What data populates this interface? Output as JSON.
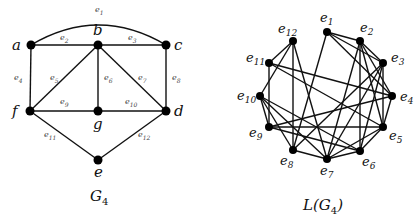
{
  "graph_g4": {
    "caption": "G",
    "caption_sub": "4",
    "vertices": [
      {
        "id": "a",
        "label": "a",
        "x": 31,
        "y": 45,
        "lx": 12,
        "ly": 50
      },
      {
        "id": "b",
        "label": "b",
        "x": 98,
        "y": 45,
        "lx": 93,
        "ly": 35
      },
      {
        "id": "c",
        "label": "c",
        "x": 166,
        "y": 45,
        "lx": 174,
        "ly": 50
      },
      {
        "id": "f",
        "label": "f",
        "x": 30,
        "y": 111,
        "lx": 12,
        "ly": 116
      },
      {
        "id": "g",
        "label": "g",
        "x": 98,
        "y": 111,
        "lx": 93,
        "ly": 129
      },
      {
        "id": "d",
        "label": "d",
        "x": 166,
        "y": 111,
        "lx": 174,
        "ly": 116
      },
      {
        "id": "e",
        "label": "e",
        "x": 98,
        "y": 160,
        "lx": 94,
        "ly": 177
      }
    ],
    "edges": [
      {
        "id": "e1",
        "label": "e",
        "sub": "1",
        "from": "a",
        "to": "c",
        "curved": true,
        "lx": 95,
        "ly": 12
      },
      {
        "id": "e2",
        "label": "e",
        "sub": "2",
        "from": "a",
        "to": "b",
        "lx": 60,
        "ly": 40
      },
      {
        "id": "e3",
        "label": "e",
        "sub": "3",
        "from": "b",
        "to": "c",
        "lx": 128,
        "ly": 40
      },
      {
        "id": "e4",
        "label": "e",
        "sub": "4",
        "from": "a",
        "to": "f",
        "lx": 14,
        "ly": 80
      },
      {
        "id": "e5",
        "label": "e",
        "sub": "5",
        "from": "b",
        "to": "f",
        "lx": 50,
        "ly": 80
      },
      {
        "id": "e6",
        "label": "e",
        "sub": "6",
        "from": "b",
        "to": "g",
        "lx": 104,
        "ly": 80
      },
      {
        "id": "e7",
        "label": "e",
        "sub": "7",
        "from": "b",
        "to": "d",
        "lx": 138,
        "ly": 80
      },
      {
        "id": "e8",
        "label": "e",
        "sub": "8",
        "from": "c",
        "to": "d",
        "lx": 172,
        "ly": 80
      },
      {
        "id": "e9",
        "label": "e",
        "sub": "9",
        "from": "f",
        "to": "g",
        "lx": 60,
        "ly": 104
      },
      {
        "id": "e10",
        "label": "e",
        "sub": "10",
        "from": "g",
        "to": "d",
        "lx": 125,
        "ly": 104
      },
      {
        "id": "e11",
        "label": "e",
        "sub": "11",
        "from": "f",
        "to": "e",
        "lx": 44,
        "ly": 137
      },
      {
        "id": "e12",
        "label": "e",
        "sub": "12",
        "from": "d",
        "to": "e",
        "lx": 138,
        "ly": 137
      }
    ]
  },
  "line_graph": {
    "caption": "L(G",
    "caption_sub": "4",
    "caption_end": ")",
    "vertices": [
      {
        "id": "e1",
        "label": "e",
        "sub": "1",
        "x": 327,
        "y": 32,
        "lx": 320,
        "ly": 22
      },
      {
        "id": "e2",
        "label": "e",
        "sub": "2",
        "x": 360,
        "y": 41,
        "lx": 360,
        "ly": 32
      },
      {
        "id": "e3",
        "label": "e",
        "sub": "3",
        "x": 383,
        "y": 63,
        "lx": 391,
        "ly": 62
      },
      {
        "id": "e4",
        "label": "e",
        "sub": "4",
        "x": 392,
        "y": 96,
        "lx": 400,
        "ly": 101
      },
      {
        "id": "e5",
        "label": "e",
        "sub": "5",
        "x": 383,
        "y": 127,
        "lx": 389,
        "ly": 140
      },
      {
        "id": "e6",
        "label": "e",
        "sub": "6",
        "x": 360,
        "y": 151,
        "lx": 362,
        "ly": 166
      },
      {
        "id": "e7",
        "label": "e",
        "sub": "7",
        "x": 327,
        "y": 159,
        "lx": 320,
        "ly": 175
      },
      {
        "id": "e8",
        "label": "e",
        "sub": "8",
        "x": 293,
        "y": 150,
        "lx": 280,
        "ly": 165
      },
      {
        "id": "e9",
        "label": "e",
        "sub": "9",
        "x": 269,
        "y": 127,
        "lx": 249,
        "ly": 137
      },
      {
        "id": "e10",
        "label": "e",
        "sub": "10",
        "x": 260,
        "y": 96,
        "lx": 237,
        "ly": 100
      },
      {
        "id": "e11",
        "label": "e",
        "sub": "11",
        "x": 269,
        "y": 63,
        "lx": 246,
        "ly": 62
      },
      {
        "id": "e12",
        "label": "e",
        "sub": "12",
        "x": 293,
        "y": 41,
        "lx": 278,
        "ly": 33
      }
    ],
    "edges": [
      [
        "e1",
        "e2"
      ],
      [
        "e1",
        "e4"
      ],
      [
        "e2",
        "e4"
      ],
      [
        "e2",
        "e3"
      ],
      [
        "e2",
        "e5"
      ],
      [
        "e2",
        "e6"
      ],
      [
        "e2",
        "e7"
      ],
      [
        "e3",
        "e5"
      ],
      [
        "e3",
        "e6"
      ],
      [
        "e3",
        "e7"
      ],
      [
        "e5",
        "e6"
      ],
      [
        "e5",
        "e7"
      ],
      [
        "e6",
        "e7"
      ],
      [
        "e1",
        "e3"
      ],
      [
        "e1",
        "e8"
      ],
      [
        "e3",
        "e8"
      ],
      [
        "e7",
        "e8"
      ],
      [
        "e7",
        "e10"
      ],
      [
        "e7",
        "e12"
      ],
      [
        "e8",
        "e10"
      ],
      [
        "e8",
        "e12"
      ],
      [
        "e10",
        "e12"
      ],
      [
        "e11",
        "e12"
      ],
      [
        "e4",
        "e5"
      ],
      [
        "e4",
        "e9"
      ],
      [
        "e4",
        "e11"
      ],
      [
        "e5",
        "e9"
      ],
      [
        "e5",
        "e11"
      ],
      [
        "e9",
        "e11"
      ],
      [
        "e6",
        "e9"
      ],
      [
        "e6",
        "e10"
      ],
      [
        "e9",
        "e10"
      ]
    ]
  }
}
